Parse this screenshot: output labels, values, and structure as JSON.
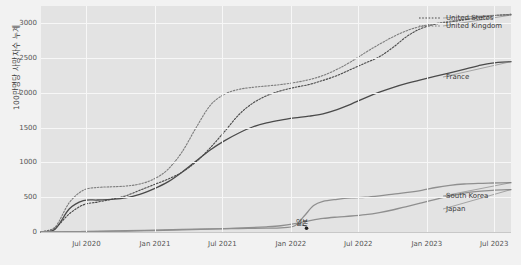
{
  "chart_data": {
    "type": "line",
    "title": "",
    "xlabel": "",
    "ylabel": "100만명당 사망자수 누계",
    "ylim": [
      0,
      3250
    ],
    "yticks": [
      0,
      500,
      1000,
      1500,
      2000,
      2500,
      3000
    ],
    "ytick_labels": [
      "0",
      "500",
      "1000",
      "1500",
      "2000",
      "2500",
      "3000"
    ],
    "xlim": [
      "2020-03-01",
      "2023-08-15"
    ],
    "xticks": [
      "2020-07-01",
      "2021-01-01",
      "2021-07-01",
      "2022-01-01",
      "2022-07-01",
      "2023-01-01",
      "2023-07-01"
    ],
    "xtick_labels": [
      "Jul 2020",
      "Jan 2021",
      "Jul 2021",
      "Jan 2022",
      "Jul 2022",
      "Jan 2023",
      "Jul 2023"
    ],
    "grid": true,
    "legend_position": "inline-right",
    "background": "#e3e3e3",
    "gridline_color": "#f7f7f7",
    "series": [
      {
        "name": "United States",
        "style": "dotted",
        "color": "#4a4a4a",
        "label_x": 446,
        "label_y": 14,
        "points": [
          [
            0.0,
            0
          ],
          [
            0.03,
            60
          ],
          [
            0.06,
            260
          ],
          [
            0.09,
            390
          ],
          [
            0.12,
            430
          ],
          [
            0.15,
            470
          ],
          [
            0.18,
            520
          ],
          [
            0.21,
            600
          ],
          [
            0.24,
            680
          ],
          [
            0.27,
            760
          ],
          [
            0.3,
            860
          ],
          [
            0.33,
            1010
          ],
          [
            0.36,
            1210
          ],
          [
            0.39,
            1440
          ],
          [
            0.42,
            1680
          ],
          [
            0.45,
            1850
          ],
          [
            0.48,
            1960
          ],
          [
            0.51,
            2030
          ],
          [
            0.54,
            2080
          ],
          [
            0.57,
            2120
          ],
          [
            0.6,
            2180
          ],
          [
            0.63,
            2250
          ],
          [
            0.66,
            2340
          ],
          [
            0.69,
            2430
          ],
          [
            0.72,
            2520
          ],
          [
            0.75,
            2660
          ],
          [
            0.78,
            2820
          ],
          [
            0.81,
            2930
          ],
          [
            0.84,
            2990
          ],
          [
            0.87,
            3020
          ],
          [
            0.9,
            3050
          ],
          [
            0.93,
            3080
          ],
          [
            0.96,
            3110
          ],
          [
            1.0,
            3130
          ]
        ]
      },
      {
        "name": "United Kingdom",
        "style": "dotted",
        "color": "#7d7d7d",
        "label_x": 446,
        "label_y": 22,
        "points": [
          [
            0.0,
            0
          ],
          [
            0.03,
            70
          ],
          [
            0.06,
            420
          ],
          [
            0.09,
            600
          ],
          [
            0.12,
            640
          ],
          [
            0.15,
            650
          ],
          [
            0.18,
            660
          ],
          [
            0.21,
            690
          ],
          [
            0.24,
            760
          ],
          [
            0.27,
            900
          ],
          [
            0.3,
            1150
          ],
          [
            0.33,
            1500
          ],
          [
            0.36,
            1820
          ],
          [
            0.39,
            1980
          ],
          [
            0.42,
            2050
          ],
          [
            0.45,
            2080
          ],
          [
            0.48,
            2100
          ],
          [
            0.51,
            2120
          ],
          [
            0.54,
            2150
          ],
          [
            0.57,
            2190
          ],
          [
            0.6,
            2250
          ],
          [
            0.63,
            2340
          ],
          [
            0.66,
            2450
          ],
          [
            0.69,
            2580
          ],
          [
            0.72,
            2700
          ],
          [
            0.75,
            2810
          ],
          [
            0.78,
            2900
          ],
          [
            0.81,
            2960
          ],
          [
            0.84,
            3000
          ],
          [
            0.87,
            3030
          ],
          [
            0.9,
            3060
          ],
          [
            0.93,
            3090
          ],
          [
            0.96,
            3110
          ],
          [
            1.0,
            3120
          ]
        ]
      },
      {
        "name": "France",
        "style": "solid",
        "color": "#4a4a4a",
        "label_x": 446,
        "label_y": 73,
        "points": [
          [
            0.0,
            0
          ],
          [
            0.03,
            40
          ],
          [
            0.06,
            330
          ],
          [
            0.09,
            450
          ],
          [
            0.12,
            460
          ],
          [
            0.15,
            470
          ],
          [
            0.18,
            490
          ],
          [
            0.21,
            540
          ],
          [
            0.24,
            620
          ],
          [
            0.27,
            720
          ],
          [
            0.3,
            860
          ],
          [
            0.33,
            1020
          ],
          [
            0.36,
            1180
          ],
          [
            0.39,
            1310
          ],
          [
            0.42,
            1420
          ],
          [
            0.45,
            1510
          ],
          [
            0.48,
            1570
          ],
          [
            0.51,
            1610
          ],
          [
            0.54,
            1640
          ],
          [
            0.57,
            1665
          ],
          [
            0.6,
            1700
          ],
          [
            0.63,
            1760
          ],
          [
            0.66,
            1840
          ],
          [
            0.69,
            1930
          ],
          [
            0.72,
            2010
          ],
          [
            0.75,
            2080
          ],
          [
            0.78,
            2140
          ],
          [
            0.81,
            2190
          ],
          [
            0.84,
            2240
          ],
          [
            0.87,
            2290
          ],
          [
            0.9,
            2340
          ],
          [
            0.93,
            2390
          ],
          [
            0.96,
            2430
          ],
          [
            1.0,
            2450
          ]
        ]
      },
      {
        "name": "South Korea",
        "style": "solid",
        "color": "#8f8f8f",
        "label_x": 446,
        "label_y": 192,
        "points": [
          [
            0.0,
            0
          ],
          [
            0.06,
            5
          ],
          [
            0.12,
            10
          ],
          [
            0.18,
            18
          ],
          [
            0.24,
            28
          ],
          [
            0.3,
            38
          ],
          [
            0.36,
            45
          ],
          [
            0.42,
            50
          ],
          [
            0.48,
            55
          ],
          [
            0.51,
            60
          ],
          [
            0.54,
            90
          ],
          [
            0.56,
            230
          ],
          [
            0.58,
            380
          ],
          [
            0.6,
            440
          ],
          [
            0.63,
            470
          ],
          [
            0.66,
            490
          ],
          [
            0.69,
            500
          ],
          [
            0.72,
            520
          ],
          [
            0.75,
            545
          ],
          [
            0.78,
            570
          ],
          [
            0.81,
            600
          ],
          [
            0.84,
            640
          ],
          [
            0.87,
            670
          ],
          [
            0.9,
            690
          ],
          [
            0.93,
            700
          ],
          [
            0.96,
            705
          ],
          [
            1.0,
            710
          ]
        ]
      },
      {
        "name": "Japan",
        "style": "solid",
        "color": "#8f8f8f",
        "label_x": 446,
        "label_y": 205,
        "points": [
          [
            0.0,
            0
          ],
          [
            0.06,
            4
          ],
          [
            0.12,
            8
          ],
          [
            0.18,
            14
          ],
          [
            0.24,
            20
          ],
          [
            0.3,
            30
          ],
          [
            0.36,
            40
          ],
          [
            0.42,
            55
          ],
          [
            0.48,
            75
          ],
          [
            0.51,
            90
          ],
          [
            0.54,
            120
          ],
          [
            0.57,
            160
          ],
          [
            0.6,
            195
          ],
          [
            0.63,
            215
          ],
          [
            0.66,
            230
          ],
          [
            0.69,
            250
          ],
          [
            0.72,
            280
          ],
          [
            0.75,
            320
          ],
          [
            0.78,
            370
          ],
          [
            0.81,
            420
          ],
          [
            0.84,
            470
          ],
          [
            0.87,
            520
          ],
          [
            0.9,
            560
          ],
          [
            0.93,
            585
          ],
          [
            0.96,
            600
          ],
          [
            1.0,
            610
          ]
        ]
      }
    ],
    "annotations": [
      {
        "text": "일본",
        "x_frac": 0.555,
        "y_value": 130,
        "marker_x_frac": 0.565,
        "marker_y_value": 55
      }
    ]
  }
}
